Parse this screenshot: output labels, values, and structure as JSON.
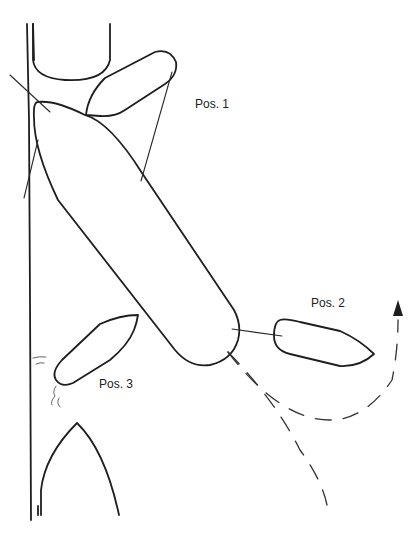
{
  "diagram": {
    "type": "ship-maneuvering-sketch",
    "labels": {
      "pos1": "Pos. 1",
      "pos2": "Pos. 2",
      "pos3": "Pos. 3"
    },
    "elements": {
      "quay": "quay-wall",
      "moored_ship_top": "moored-ship-stern",
      "moored_ship_bottom": "moored-ship-bow",
      "main_ship": "maneuvering-ship",
      "tug_pos1": "tug-position-1",
      "tug_pos2": "tug-position-2",
      "tug_pos3": "tug-position-3",
      "track_dashed": "tug-track-dashed",
      "arrow": "direction-arrow"
    },
    "colors": {
      "ink": "#1e1e1e",
      "background": "#ffffff"
    }
  }
}
